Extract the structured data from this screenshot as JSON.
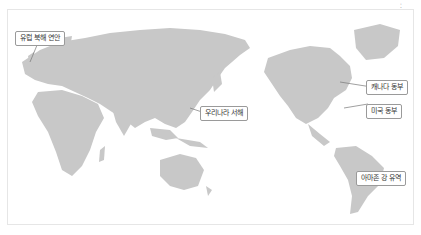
{
  "map": {
    "land_color": "#c8c8c8",
    "leader_color": "#777777",
    "callouts": [
      {
        "id": "europe",
        "label": "유럽 북해 연안"
      },
      {
        "id": "korea",
        "label": "우리나라 서해"
      },
      {
        "id": "canada",
        "label": "캐나다 동부"
      },
      {
        "id": "usa",
        "label": "미국 동부"
      },
      {
        "id": "amazon",
        "label": "아마존 강 유역"
      }
    ]
  }
}
